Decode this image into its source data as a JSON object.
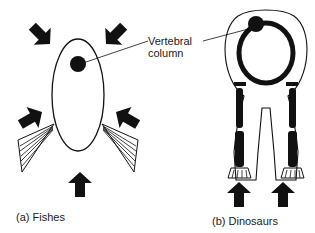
{
  "diagram": {
    "callout": {
      "line1": "Vertebral",
      "line2": "column"
    },
    "panels": [
      {
        "id": "a",
        "caption": "(a) Fishes"
      },
      {
        "id": "b",
        "caption": "(b) Dinosaurs"
      }
    ],
    "colors": {
      "ink": "#111111",
      "background": "#ffffff"
    }
  }
}
